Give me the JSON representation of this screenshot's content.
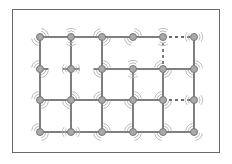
{
  "diagram": {
    "type": "mesh-network-grid",
    "columns": 6,
    "rows": 4,
    "column_x": [
      40,
      71,
      102,
      133,
      163,
      194
    ],
    "row_y": [
      37,
      69,
      100,
      132
    ],
    "colors": {
      "frame": "#6a6a6a",
      "node_fill": "#a9a9a9",
      "node_stroke": "#777777",
      "link": "#3a3a3a",
      "wave": "#b5b5b5"
    },
    "node_radius": 3.5,
    "horizontal_links": [
      {
        "row": 0,
        "from": 0,
        "to": 1,
        "style": "solid"
      },
      {
        "row": 0,
        "from": 1,
        "to": 2,
        "style": "solid"
      },
      {
        "row": 0,
        "from": 2,
        "to": 3,
        "style": "solid"
      },
      {
        "row": 0,
        "from": 3,
        "to": 4,
        "style": "solid"
      },
      {
        "row": 0,
        "from": 4,
        "to": 5,
        "style": "dashed"
      },
      {
        "row": 1,
        "from": 0,
        "to": 1,
        "style": "stub"
      },
      {
        "row": 1,
        "from": 1,
        "to": 2,
        "style": "stub"
      },
      {
        "row": 1,
        "from": 2,
        "to": 3,
        "style": "solid"
      },
      {
        "row": 1,
        "from": 3,
        "to": 4,
        "style": "solid"
      },
      {
        "row": 1,
        "from": 4,
        "to": 5,
        "style": "solid"
      },
      {
        "row": 2,
        "from": 0,
        "to": 1,
        "style": "solid"
      },
      {
        "row": 2,
        "from": 1,
        "to": 2,
        "style": "solid"
      },
      {
        "row": 2,
        "from": 2,
        "to": 3,
        "style": "solid"
      },
      {
        "row": 2,
        "from": 3,
        "to": 4,
        "style": "solid"
      },
      {
        "row": 2,
        "from": 4,
        "to": 5,
        "style": "dashed"
      },
      {
        "row": 3,
        "from": 0,
        "to": 1,
        "style": "solid"
      },
      {
        "row": 3,
        "from": 1,
        "to": 2,
        "style": "solid"
      },
      {
        "row": 3,
        "from": 2,
        "to": 3,
        "style": "solid"
      },
      {
        "row": 3,
        "from": 3,
        "to": 4,
        "style": "solid"
      },
      {
        "row": 3,
        "from": 4,
        "to": 5,
        "style": "solid"
      }
    ],
    "vertical_links": [
      {
        "col": 0,
        "from": 0,
        "to": 1,
        "style": "solid"
      },
      {
        "col": 0,
        "from": 1,
        "to": 2,
        "style": "solid"
      },
      {
        "col": 0,
        "from": 2,
        "to": 3,
        "style": "solid"
      },
      {
        "col": 1,
        "from": 0,
        "to": 1,
        "style": "solid"
      },
      {
        "col": 1,
        "from": 1,
        "to": 2,
        "style": "solid"
      },
      {
        "col": 1,
        "from": 2,
        "to": 3,
        "style": "solid"
      },
      {
        "col": 2,
        "from": 0,
        "to": 1,
        "style": "solid"
      },
      {
        "col": 2,
        "from": 1,
        "to": 2,
        "style": "solid"
      },
      {
        "col": 2,
        "from": 2,
        "to": 3,
        "style": "solid"
      },
      {
        "col": 3,
        "from": 1,
        "to": 2,
        "style": "solid"
      },
      {
        "col": 3,
        "from": 2,
        "to": 3,
        "style": "solid"
      },
      {
        "col": 4,
        "from": 0,
        "to": 1,
        "style": "dashed"
      },
      {
        "col": 4,
        "from": 1,
        "to": 2,
        "style": "solid"
      },
      {
        "col": 4,
        "from": 2,
        "to": 3,
        "style": "solid"
      },
      {
        "col": 5,
        "from": 0,
        "to": 1,
        "style": "solid"
      },
      {
        "col": 5,
        "from": 1,
        "to": 2,
        "style": "solid"
      },
      {
        "col": 5,
        "from": 2,
        "to": 3,
        "style": "solid"
      }
    ],
    "waves": [
      {
        "row": 0,
        "col": 0,
        "dir": "diag-ur"
      },
      {
        "row": 0,
        "col": 1,
        "dir": "vertical"
      },
      {
        "row": 0,
        "col": 2,
        "dir": "diag-ul"
      },
      {
        "row": 0,
        "col": 3,
        "dir": "diag-ur"
      },
      {
        "row": 0,
        "col": 4,
        "dir": "vertical"
      },
      {
        "row": 0,
        "col": 5,
        "dir": "horizontal"
      },
      {
        "row": 1,
        "col": 0,
        "dir": "diag-ul"
      },
      {
        "row": 1,
        "col": 1,
        "dir": "horizontal"
      },
      {
        "row": 1,
        "col": 2,
        "dir": "diag-ur"
      },
      {
        "row": 1,
        "col": 3,
        "dir": "vertical"
      },
      {
        "row": 1,
        "col": 4,
        "dir": "diag-ul"
      },
      {
        "row": 1,
        "col": 5,
        "dir": "diag-ur"
      },
      {
        "row": 2,
        "col": 0,
        "dir": "diag-ul"
      },
      {
        "row": 2,
        "col": 1,
        "dir": "diag-ur"
      },
      {
        "row": 2,
        "col": 2,
        "dir": "diag-ul"
      },
      {
        "row": 2,
        "col": 3,
        "dir": "diag-ur"
      },
      {
        "row": 2,
        "col": 4,
        "dir": "diag-ul"
      },
      {
        "row": 2,
        "col": 5,
        "dir": "horizontal"
      },
      {
        "row": 3,
        "col": 0,
        "dir": "diag-ul"
      },
      {
        "row": 3,
        "col": 1,
        "dir": "horizontal"
      },
      {
        "row": 3,
        "col": 2,
        "dir": "diag-ur"
      },
      {
        "row": 3,
        "col": 3,
        "dir": "diag-ul"
      },
      {
        "row": 3,
        "col": 4,
        "dir": "diag-ur"
      },
      {
        "row": 3,
        "col": 5,
        "dir": "diag-ul"
      }
    ]
  }
}
